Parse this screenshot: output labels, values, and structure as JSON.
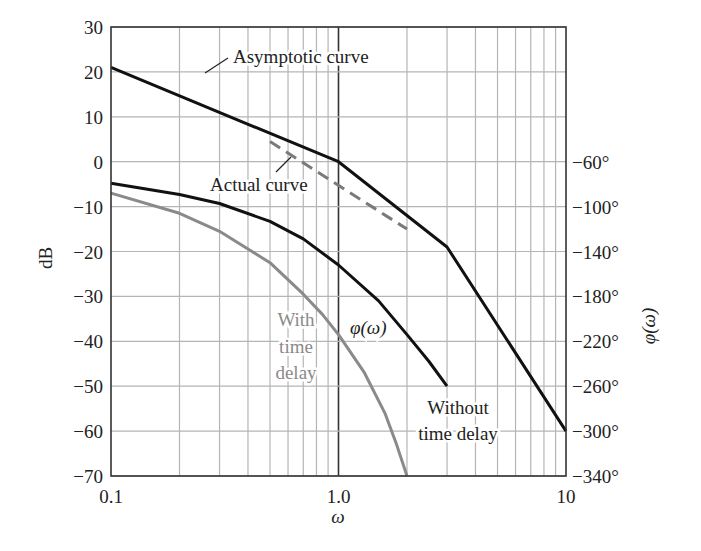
{
  "chart_data": {
    "type": "line",
    "title": "",
    "xlabel": "ω",
    "ylabel": "dB",
    "ylabel_right": "φ(ω)",
    "xscale": "log",
    "xlim": [
      0.1,
      10
    ],
    "ylim": [
      -70,
      30
    ],
    "grid": true,
    "x_ticks": [
      {
        "value": 0.1,
        "label": "0.1"
      },
      {
        "value": 1.0,
        "label": "1.0"
      },
      {
        "value": 10,
        "label": "10"
      }
    ],
    "y_ticks": [
      30,
      20,
      10,
      0,
      -10,
      -20,
      -30,
      -40,
      -50,
      -60,
      -70
    ],
    "y_tick_labels": [
      "30",
      "20",
      "10",
      "0",
      "−10",
      "−20",
      "−30",
      "−40",
      "−50",
      "−60",
      "−70"
    ],
    "right_ticks": [
      {
        "db": 0,
        "label": "−60°"
      },
      {
        "db": -10,
        "label": "−100°"
      },
      {
        "db": -20,
        "label": "−140°"
      },
      {
        "db": -30,
        "label": "−180°"
      },
      {
        "db": -40,
        "label": "−220°"
      },
      {
        "db": -50,
        "label": "−260°"
      },
      {
        "db": -60,
        "label": "−300°"
      },
      {
        "db": -70,
        "label": "−340°"
      }
    ],
    "series": [
      {
        "name": "Asymptotic curve",
        "color": "#111111",
        "dash": "",
        "width": 3,
        "x": [
          0.1,
          1.0,
          3.0,
          10
        ],
        "y": [
          21,
          0,
          -19,
          -60
        ]
      },
      {
        "name": "Actual curve",
        "color": "#7a7a7a",
        "dash": "12,7",
        "width": 3,
        "x": [
          0.5,
          2.0
        ],
        "y": [
          4.5,
          -15
        ]
      },
      {
        "name": "φ(ω) without time delay",
        "color": "#111111",
        "dash": "",
        "width": 3,
        "x": [
          0.1,
          0.2,
          0.3,
          0.5,
          0.7,
          1.0,
          1.5,
          2.0,
          2.5,
          3.0
        ],
        "y": [
          -4.8,
          -7.3,
          -9.3,
          -13.3,
          -17.2,
          -23,
          -31,
          -38.5,
          -44.5,
          -50
        ]
      },
      {
        "name": "φ(ω) with time delay",
        "color": "#8a8a8a",
        "dash": "",
        "width": 3,
        "x": [
          0.1,
          0.2,
          0.3,
          0.5,
          0.7,
          0.85,
          1.0,
          1.3,
          1.6,
          1.8,
          2.0
        ],
        "y": [
          -7,
          -11.5,
          -15.5,
          -22.5,
          -29.5,
          -34,
          -38.5,
          -47,
          -56,
          -63,
          -70
        ]
      }
    ],
    "annotations": [
      {
        "text": "Asymptotic curve",
        "x": 233,
        "y": 63,
        "style": "dark",
        "leader": [
          [
            205,
            73
          ],
          [
            228,
            58
          ]
        ]
      },
      {
        "text": "Actual curve",
        "x": 210,
        "y": 191,
        "style": "dark",
        "leader": [
          [
            276,
            172
          ],
          [
            291,
            157
          ]
        ]
      },
      {
        "text": "φ(ω)",
        "x": 350,
        "y": 334,
        "style": "dark-italic"
      },
      {
        "text": "With",
        "x": 296,
        "y": 326,
        "style": "gray",
        "anchor": "middle"
      },
      {
        "text": "time",
        "x": 296,
        "y": 353,
        "style": "gray",
        "anchor": "middle"
      },
      {
        "text": "delay",
        "x": 296,
        "y": 379,
        "style": "gray",
        "anchor": "middle"
      },
      {
        "text": "Without",
        "x": 458,
        "y": 414,
        "style": "dark",
        "anchor": "middle"
      },
      {
        "text": "time delay",
        "x": 458,
        "y": 440,
        "style": "dark",
        "anchor": "middle"
      }
    ]
  }
}
